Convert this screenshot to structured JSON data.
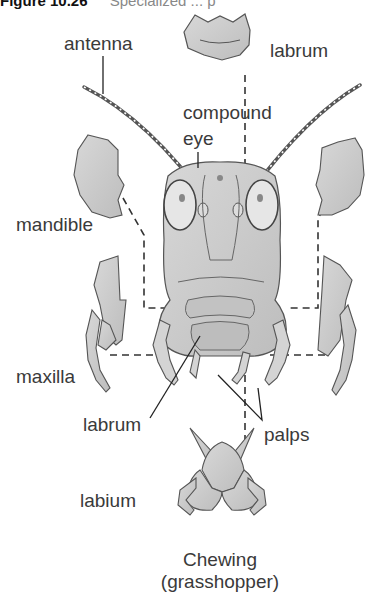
{
  "figure": {
    "number": "Figure 10.26",
    "title_fragment": "Specialized ... p"
  },
  "labels": {
    "antenna": "antenna",
    "labrum_top": "labrum",
    "compound": "compound",
    "eye": "eye",
    "mandible": "mandible",
    "maxilla": "maxilla",
    "labrum_bottom": "labrum",
    "palps": "palps",
    "labium": "labium"
  },
  "caption": {
    "line1": "Chewing",
    "line2": "(grasshopper)"
  },
  "colors": {
    "fill": "#c9c9c9",
    "outline": "#555555",
    "leader": "#222222",
    "text": "#3a3a3a"
  }
}
